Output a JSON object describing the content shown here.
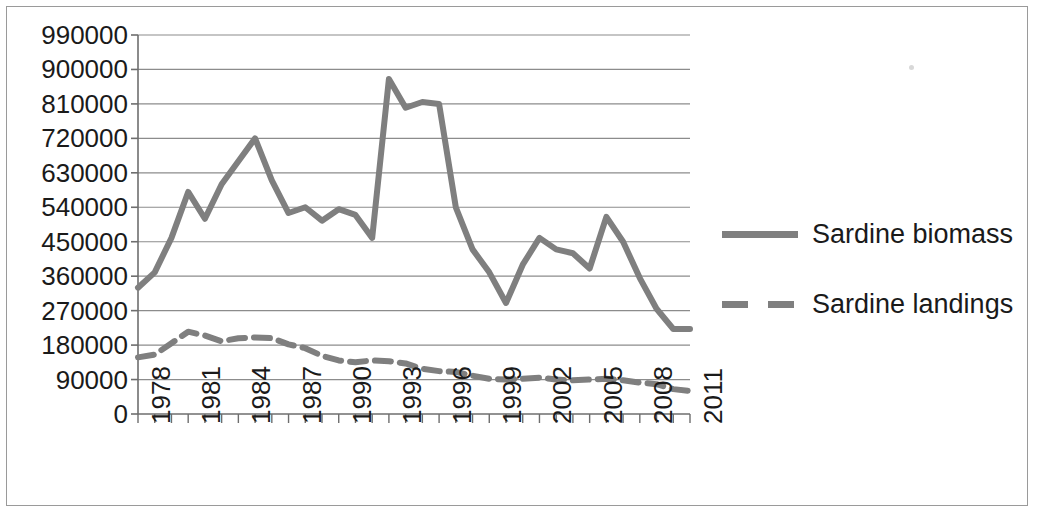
{
  "chart_data": {
    "type": "line",
    "title": "",
    "xlabel": "",
    "ylabel": "",
    "xlim": [
      1978,
      2011
    ],
    "ylim": [
      0,
      990000
    ],
    "ytick_step": 90000,
    "grid": true,
    "legend_position": "right",
    "x": [
      1978,
      1979,
      1980,
      1981,
      1982,
      1983,
      1984,
      1985,
      1986,
      1987,
      1988,
      1989,
      1990,
      1991,
      1992,
      1993,
      1994,
      1995,
      1996,
      1997,
      1998,
      1999,
      2000,
      2001,
      2002,
      2003,
      2004,
      2005,
      2006,
      2007,
      2008,
      2009,
      2010,
      2011
    ],
    "xtick_labels": [
      "1978",
      "1981",
      "1984",
      "1987",
      "1990",
      "1993",
      "1996",
      "1999",
      "2002",
      "2005",
      "2008",
      "2011"
    ],
    "ytick_labels": [
      "0",
      "90000",
      "180000",
      "270000",
      "360000",
      "450000",
      "540000",
      "630000",
      "720000",
      "810000",
      "900000",
      "990000"
    ],
    "series": [
      {
        "name": "Sardine biomass",
        "style": "solid",
        "color": "#7f7f7f",
        "values": [
          330000,
          370000,
          460000,
          580000,
          510000,
          600000,
          660000,
          720000,
          610000,
          525000,
          540000,
          505000,
          535000,
          520000,
          460000,
          875000,
          800000,
          815000,
          810000,
          540000,
          430000,
          370000,
          290000,
          390000,
          460000,
          430000,
          420000,
          380000,
          515000,
          450000,
          355000,
          275000,
          222000,
          222000
        ]
      },
      {
        "name": "Sardine landings",
        "style": "dashed",
        "color": "#7f7f7f",
        "values": [
          148000,
          155000,
          185000,
          215000,
          205000,
          190000,
          198000,
          200000,
          198000,
          182000,
          172000,
          152000,
          140000,
          135000,
          140000,
          138000,
          132000,
          118000,
          112000,
          110000,
          100000,
          92000,
          90000,
          92000,
          95000,
          90000,
          88000,
          90000,
          92000,
          88000,
          82000,
          78000,
          65000,
          60000
        ]
      }
    ]
  },
  "legend": {
    "items": [
      {
        "label": "Sardine biomass",
        "style": "solid"
      },
      {
        "label": "Sardine landings",
        "style": "dashed"
      }
    ]
  }
}
